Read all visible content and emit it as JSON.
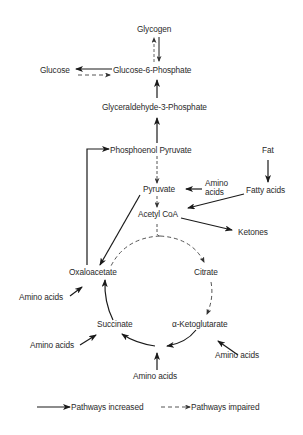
{
  "diagram": {
    "type": "metabolic-pathway",
    "nodes": {
      "glycogen": "Glycogen",
      "glucose": "Glucose",
      "glucose6p": "Glucose-6-Phosphate",
      "g3p": "Glyceraldehyde-3-Phosphate",
      "pep": "Phosphoenol Pyruvate",
      "fat": "Fat",
      "amino_pyruvate_1": "Amino",
      "amino_pyruvate_2": "acids",
      "pyruvate": "Pyruvate",
      "fatty_acids": "Fatty acids",
      "acetyl_coa": "Acetyl CoA",
      "ketones": "Ketones",
      "oxaloacetate": "Oxaloacetate",
      "citrate": "Citrate",
      "amino_oxaloacetate": "Amino acids",
      "succinate": "Succinate",
      "alpha_kg": "α-Ketoglutarate",
      "amino_succinate": "Amino acids",
      "amino_alpha_kg": "Amino acids",
      "amino_bottom": "Amino acids"
    },
    "edges": [
      {
        "from": "Glycogen",
        "to": "Glucose-6-Phosphate",
        "style": "solid"
      },
      {
        "from": "Glucose-6-Phosphate",
        "to": "Glycogen",
        "style": "dashed"
      },
      {
        "from": "Glucose-6-Phosphate",
        "to": "Glucose",
        "style": "solid"
      },
      {
        "from": "Glucose",
        "to": "Glucose-6-Phosphate",
        "style": "dashed"
      },
      {
        "from": "Glyceraldehyde-3-Phosphate",
        "to": "Glucose-6-Phosphate",
        "style": "solid"
      },
      {
        "from": "Phosphoenol Pyruvate",
        "to": "Glyceraldehyde-3-Phosphate",
        "style": "solid"
      },
      {
        "from": "Phosphoenol Pyruvate",
        "to": "Pyruvate",
        "style": "dashed"
      },
      {
        "from": "Oxaloacetate",
        "to": "Phosphoenol Pyruvate",
        "style": "solid"
      },
      {
        "from": "Amino acids",
        "to": "Pyruvate",
        "style": "solid"
      },
      {
        "from": "Fat",
        "to": "Fatty acids",
        "style": "solid"
      },
      {
        "from": "Fatty acids",
        "to": "Acetyl CoA",
        "style": "solid"
      },
      {
        "from": "Pyruvate",
        "to": "Acetyl CoA",
        "style": "dashed"
      },
      {
        "from": "Pyruvate",
        "to": "Oxaloacetate",
        "style": "solid"
      },
      {
        "from": "Acetyl CoA",
        "to": "Ketones",
        "style": "solid"
      },
      {
        "from": "Acetyl CoA",
        "to": "Citrate",
        "style": "dashed"
      },
      {
        "from": "Acetyl CoA",
        "to": "Oxaloacetate",
        "style": "dashed"
      },
      {
        "from": "Citrate",
        "to": "α-Ketoglutarate",
        "style": "dashed"
      },
      {
        "from": "α-Ketoglutarate",
        "to": "Succinate",
        "style": "solid"
      },
      {
        "from": "Succinate",
        "to": "Oxaloacetate",
        "style": "solid"
      },
      {
        "from": "Amino acids",
        "to": "Oxaloacetate",
        "style": "solid"
      },
      {
        "from": "Amino acids",
        "to": "Succinate",
        "style": "solid"
      },
      {
        "from": "Amino acids",
        "to": "α-Ketoglutarate",
        "style": "solid"
      },
      {
        "from": "Amino acids",
        "to": "Succinate/α-KG junction",
        "style": "solid"
      }
    ],
    "legend": {
      "increased": "Pathways increased",
      "impaired": "Pathways impaired"
    },
    "colors": {
      "ink": "#1a1a1a",
      "dashed_ink": "#555555",
      "background": "#ffffff"
    }
  }
}
